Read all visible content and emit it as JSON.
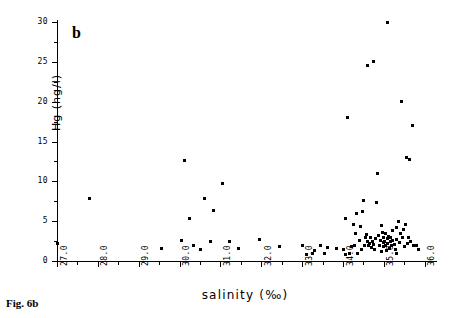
{
  "figure": {
    "caption": "Fig. 6b",
    "panel_label": "b"
  },
  "chart_data": {
    "type": "scatter",
    "title": "",
    "panel": "b",
    "xlabel": "salinity (‰)",
    "ylabel": "Hg (ng/l)",
    "xlim": [
      27.0,
      36.3
    ],
    "ylim": [
      0,
      30
    ],
    "grid": false,
    "legend": null,
    "marker": "small filled square",
    "marker_color": "#000000",
    "x_ticks": [
      "27.0",
      "28.0",
      "29.0",
      "30.0",
      "31.0",
      "32.0",
      "33.0",
      "34.0",
      "35.0",
      "36.0"
    ],
    "x_tick_values": [
      27.0,
      28.0,
      29.0,
      30.0,
      31.0,
      32.0,
      33.0,
      34.0,
      35.0,
      36.0
    ],
    "x_minor_interval": 0.5,
    "y_ticks": [
      "0",
      "5",
      "10",
      "15",
      "20",
      "25",
      "30"
    ],
    "y_tick_values": [
      0,
      5,
      10,
      15,
      20,
      25,
      30
    ],
    "y_minor_interval": 2.5,
    "points": [
      [
        27.0,
        2.2
      ],
      [
        27.8,
        7.8
      ],
      [
        29.55,
        1.6
      ],
      [
        30.05,
        2.6
      ],
      [
        30.12,
        12.6
      ],
      [
        30.25,
        5.3
      ],
      [
        30.35,
        2.0
      ],
      [
        30.5,
        1.4
      ],
      [
        30.62,
        7.9
      ],
      [
        30.75,
        2.5
      ],
      [
        30.82,
        6.4
      ],
      [
        31.05,
        9.7
      ],
      [
        31.22,
        2.5
      ],
      [
        31.45,
        1.6
      ],
      [
        31.95,
        2.7
      ],
      [
        32.45,
        1.8
      ],
      [
        33.0,
        2.0
      ],
      [
        33.25,
        1.0
      ],
      [
        33.3,
        1.3
      ],
      [
        33.45,
        2.0
      ],
      [
        33.55,
        0.9
      ],
      [
        33.62,
        1.7
      ],
      [
        33.85,
        1.6
      ],
      [
        34.0,
        1.5
      ],
      [
        34.05,
        5.3
      ],
      [
        34.1,
        18.0
      ],
      [
        34.2,
        1.8
      ],
      [
        34.28,
        2.0
      ],
      [
        34.3,
        3.5
      ],
      [
        34.35,
        1.0
      ],
      [
        34.4,
        2.6
      ],
      [
        34.42,
        4.3
      ],
      [
        34.45,
        1.4
      ],
      [
        34.5,
        7.6
      ],
      [
        34.52,
        2.0
      ],
      [
        34.55,
        3.0
      ],
      [
        34.58,
        3.3
      ],
      [
        34.6,
        2.5
      ],
      [
        34.62,
        1.9
      ],
      [
        34.65,
        2.2
      ],
      [
        34.68,
        3.0
      ],
      [
        34.7,
        1.7
      ],
      [
        34.72,
        2.4
      ],
      [
        34.75,
        2.1
      ],
      [
        34.78,
        1.5
      ],
      [
        34.8,
        2.8
      ],
      [
        34.82,
        7.4
      ],
      [
        34.85,
        11.0
      ],
      [
        34.88,
        3.2
      ],
      [
        34.9,
        2.0
      ],
      [
        34.92,
        2.6
      ],
      [
        34.94,
        1.2
      ],
      [
        34.95,
        4.5
      ],
      [
        34.96,
        3.6
      ],
      [
        34.98,
        2.3
      ],
      [
        35.0,
        1.8
      ],
      [
        35.0,
        3.0
      ],
      [
        35.02,
        2.5
      ],
      [
        35.04,
        3.4
      ],
      [
        35.05,
        2.0
      ],
      [
        35.06,
        1.3
      ],
      [
        35.08,
        2.8
      ],
      [
        35.1,
        30.0
      ],
      [
        35.1,
        2.2
      ],
      [
        35.12,
        3.1
      ],
      [
        35.14,
        1.6
      ],
      [
        35.15,
        2.4
      ],
      [
        35.16,
        2.9
      ],
      [
        35.18,
        1.9
      ],
      [
        35.2,
        2.6
      ],
      [
        35.22,
        3.8
      ],
      [
        35.25,
        2.1
      ],
      [
        35.28,
        1.4
      ],
      [
        35.3,
        2.7
      ],
      [
        35.32,
        4.2
      ],
      [
        35.35,
        5.0
      ],
      [
        35.38,
        2.3
      ],
      [
        35.4,
        3.4
      ],
      [
        35.42,
        20.0
      ],
      [
        35.45,
        2.9
      ],
      [
        35.48,
        4.0
      ],
      [
        35.5,
        1.8
      ],
      [
        35.52,
        4.6
      ],
      [
        35.55,
        13.0
      ],
      [
        35.58,
        2.2
      ],
      [
        35.6,
        3.0
      ],
      [
        35.62,
        12.8
      ],
      [
        35.65,
        2.5
      ],
      [
        35.7,
        17.0
      ],
      [
        35.72,
        1.9
      ],
      [
        35.8,
        2.0
      ],
      [
        34.6,
        24.6
      ],
      [
        34.75,
        25.0
      ],
      [
        34.32,
        6.0
      ],
      [
        34.48,
        6.2
      ],
      [
        34.25,
        4.6
      ],
      [
        33.1,
        0.8
      ],
      [
        34.15,
        0.9
      ],
      [
        35.85,
        1.4
      ],
      [
        35.3,
        0.9
      ],
      [
        34.05,
        0.8
      ]
    ]
  }
}
